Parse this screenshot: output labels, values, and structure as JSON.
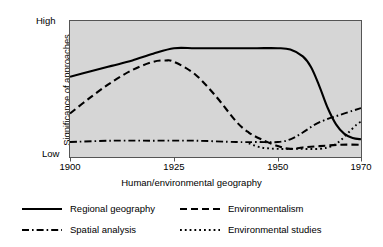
{
  "chart_data": {
    "type": "line",
    "title": "",
    "xlabel": "Human/environmental geography",
    "ylabel_line1": "Significance of approaches",
    "ylabel_line2": "to geographic research",
    "xlim": [
      1900,
      1970
    ],
    "xticks": [
      1900,
      1925,
      1950,
      1970
    ],
    "xticklabels": [
      "1900",
      "1925",
      "1950",
      "1970"
    ],
    "ylim": [
      0,
      100
    ],
    "yticklabels": [
      "Low",
      "High"
    ],
    "ytick_low": "Low",
    "ytick_high": "High",
    "grid": false,
    "plot_background": "#d6d6d6",
    "line_color": "#000000",
    "legend_position": "below-plot",
    "series": [
      {
        "name": "Regional geography",
        "style": "solid",
        "x": [
          1900,
          1905,
          1910,
          1915,
          1920,
          1925,
          1930,
          1935,
          1940,
          1945,
          1950,
          1953,
          1956,
          1958,
          1960,
          1962,
          1964,
          1966,
          1968,
          1970
        ],
        "y": [
          59,
          63,
          67,
          71,
          76,
          80,
          80,
          80,
          80,
          80,
          80,
          79,
          74,
          66,
          52,
          36,
          24,
          17,
          14,
          13
        ]
      },
      {
        "name": "Environmentalism",
        "style": "dashed",
        "x": [
          1900,
          1905,
          1910,
          1915,
          1920,
          1923,
          1925,
          1930,
          1935,
          1940,
          1943,
          1946,
          1950,
          1953,
          1956,
          1960,
          1965,
          1970
        ],
        "y": [
          32,
          44,
          55,
          64,
          70,
          71,
          70,
          61,
          45,
          26,
          18,
          13,
          8,
          6,
          7,
          8,
          9,
          9
        ]
      },
      {
        "name": "Spatial analysis",
        "style": "dashdot",
        "x": [
          1900,
          1910,
          1920,
          1930,
          1940,
          1945,
          1950,
          1953,
          1956,
          1959,
          1962,
          1965,
          1968,
          1970
        ],
        "y": [
          11,
          12,
          12,
          12,
          11,
          11,
          11,
          13,
          18,
          24,
          28,
          31,
          34,
          36
        ]
      },
      {
        "name": "Environmental studies",
        "style": "dotted",
        "x": [
          1943,
          1946,
          1950,
          1955,
          1960,
          1963,
          1965,
          1967,
          1969,
          1970
        ],
        "y": [
          10,
          7,
          6,
          6,
          6,
          8,
          12,
          18,
          24,
          26
        ]
      }
    ]
  },
  "legend": {
    "rows": [
      [
        {
          "label": "Regional geography",
          "style": "solid"
        },
        {
          "label": "Environmentalism",
          "style": "dashed"
        }
      ],
      [
        {
          "label": "Spatial analysis",
          "style": "dashdot"
        },
        {
          "label": "Environmental studies",
          "style": "dotted"
        }
      ]
    ]
  }
}
